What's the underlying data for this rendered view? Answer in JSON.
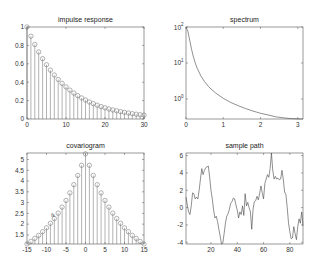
{
  "chart_data": [
    {
      "type": "stem",
      "title": "impulse response",
      "xlabel": "",
      "ylabel": "",
      "xlim": [
        0,
        30
      ],
      "ylim": [
        0,
        1
      ],
      "xticks": [
        0,
        10,
        20,
        30
      ],
      "yticks": [
        0,
        0.2,
        0.4,
        0.6,
        0.8,
        1
      ],
      "ytick_labels": [
        "0",
        "0.2",
        "0.4",
        "0.6",
        "0.8",
        "1"
      ],
      "x": [
        0,
        1,
        2,
        3,
        4,
        5,
        6,
        7,
        8,
        9,
        10,
        11,
        12,
        13,
        14,
        15,
        16,
        17,
        18,
        19,
        20,
        21,
        22,
        23,
        24,
        25,
        26,
        27,
        28,
        29,
        30
      ],
      "values": [
        1.0,
        0.9,
        0.81,
        0.729,
        0.656,
        0.59,
        0.531,
        0.478,
        0.43,
        0.387,
        0.349,
        0.314,
        0.282,
        0.254,
        0.229,
        0.206,
        0.185,
        0.167,
        0.15,
        0.135,
        0.122,
        0.109,
        0.098,
        0.089,
        0.08,
        0.072,
        0.065,
        0.058,
        0.052,
        0.047,
        0.042
      ],
      "grid": false
    },
    {
      "type": "line",
      "title": "spectrum",
      "xlabel": "",
      "ylabel": "",
      "yscale": "log",
      "xlim": [
        0,
        3.1416
      ],
      "ylim": [
        0.277,
        100
      ],
      "xticks": [
        0,
        1,
        2,
        3
      ],
      "yticks": [
        1,
        10,
        100
      ],
      "ytick_labels": [
        "10^0",
        "10^1",
        "10^2"
      ],
      "x": [
        0,
        0.05,
        0.1,
        0.15,
        0.2,
        0.25,
        0.3,
        0.4,
        0.5,
        0.6,
        0.7,
        0.8,
        1.0,
        1.2,
        1.4,
        1.6,
        1.8,
        2.0,
        2.2,
        2.4,
        2.6,
        2.8,
        3.0,
        3.1416
      ],
      "values": [
        100,
        76.2,
        42.5,
        23.8,
        14.7,
        9.9,
        7.15,
        4.35,
        3.0,
        2.24,
        1.77,
        1.45,
        1.04,
        0.8,
        0.65,
        0.54,
        0.46,
        0.4,
        0.36,
        0.32,
        0.3,
        0.285,
        0.279,
        0.277
      ],
      "grid": false
    },
    {
      "type": "stem",
      "title": "covariogram",
      "xlabel": "",
      "ylabel": "",
      "xlim": [
        -15,
        15
      ],
      "ylim": [
        1.08,
        5.3
      ],
      "xticks": [
        -15,
        -10,
        -5,
        0,
        5,
        10,
        15
      ],
      "yticks": [
        1.5,
        2,
        2.5,
        3,
        3.5,
        4,
        4.5,
        5
      ],
      "ytick_labels": [
        "1.5",
        "2",
        "2.5",
        "3",
        "3.5",
        "4",
        "4.5",
        "5"
      ],
      "x": [
        -15,
        -14,
        -13,
        -12,
        -11,
        -10,
        -9,
        -8,
        -7,
        -6,
        -5,
        -4,
        -3,
        -2,
        -1,
        0,
        1,
        2,
        3,
        4,
        5,
        6,
        7,
        8,
        9,
        10,
        11,
        12,
        13,
        14,
        15
      ],
      "values": [
        1.08,
        1.2,
        1.34,
        1.48,
        1.65,
        1.83,
        2.04,
        2.26,
        2.51,
        2.79,
        3.1,
        3.45,
        3.83,
        4.26,
        4.73,
        5.26,
        4.73,
        4.26,
        3.83,
        3.45,
        3.1,
        2.79,
        2.51,
        2.26,
        2.04,
        1.83,
        1.65,
        1.48,
        1.34,
        1.2,
        1.08
      ],
      "annotation": {
        "text": "fs",
        "x": -8.3,
        "y": 2.35
      },
      "grid": false
    },
    {
      "type": "line",
      "title": "sample path",
      "xlabel": "",
      "ylabel": "",
      "xlim": [
        1,
        90
      ],
      "ylim": [
        -4.2,
        6.3
      ],
      "xticks": [
        20,
        40,
        60,
        80
      ],
      "yticks": [
        -4,
        -2,
        0,
        2,
        4,
        6
      ],
      "ytick_labels": [
        "-4",
        "-2",
        "0",
        "2",
        "4",
        "6"
      ],
      "x": [
        1,
        2,
        3,
        4,
        5,
        6,
        7,
        8,
        9,
        10,
        11,
        12,
        13,
        14,
        15,
        16,
        17,
        18,
        19,
        20,
        21,
        22,
        23,
        24,
        25,
        26,
        27,
        28,
        29,
        30,
        31,
        32,
        33,
        34,
        35,
        36,
        37,
        38,
        39,
        40,
        41,
        42,
        43,
        44,
        45,
        46,
        47,
        48,
        49,
        50,
        51,
        52,
        53,
        54,
        55,
        56,
        57,
        58,
        59,
        60,
        61,
        62,
        63,
        64,
        65,
        66,
        67,
        68,
        69,
        70,
        71,
        72,
        73,
        74,
        75,
        76,
        77,
        78,
        79,
        80,
        81,
        82,
        83,
        84,
        85,
        86,
        87,
        88,
        89,
        90
      ],
      "values": [
        1.2,
        0.3,
        -0.5,
        -0.8,
        0.2,
        1.7,
        1.6,
        1.0,
        1.2,
        1.0,
        2.0,
        3.3,
        4.5,
        3.8,
        4.3,
        4.6,
        4.7,
        4.8,
        3.5,
        2.0,
        1.0,
        -0.3,
        -1.2,
        -1.0,
        -1.6,
        -2.5,
        -3.3,
        -4.2,
        -4.1,
        -3.0,
        -1.8,
        -1.0,
        -0.7,
        -0.2,
        0.5,
        0.7,
        1.1,
        1.0,
        0.3,
        -0.3,
        -1.2,
        -0.5,
        -0.8,
        0.2,
        -0.9,
        1.6,
        0.2,
        0.6,
        0.0,
        -0.5,
        -2.5,
        -0.2,
        0.7,
        0.8,
        1.3,
        0.9,
        1.6,
        2.5,
        1.7,
        1.0,
        2.8,
        3.3,
        3.8,
        3.5,
        4.5,
        6.3,
        4.3,
        3.3,
        3.6,
        3.3,
        3.4,
        3.2,
        3.3,
        4.3,
        3.3,
        1.8,
        1.5,
        0.0,
        -1.8,
        -2.8,
        -3.6,
        -3.5,
        -2.2,
        -3.0,
        -3.7,
        -2.2,
        -1.3,
        -1.8,
        -0.5,
        -2.1
      ],
      "grid": false
    }
  ]
}
